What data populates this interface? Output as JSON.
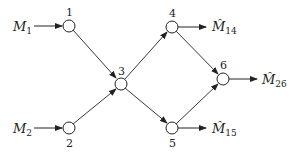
{
  "diagram": {
    "nodes": [
      {
        "id": "1",
        "label": "1"
      },
      {
        "id": "2",
        "label": "2"
      },
      {
        "id": "3",
        "label": "3"
      },
      {
        "id": "4",
        "label": "4"
      },
      {
        "id": "5",
        "label": "5"
      },
      {
        "id": "6",
        "label": "6"
      }
    ],
    "inputs": [
      {
        "to": "1",
        "symbol": "M",
        "subscript": "1"
      },
      {
        "to": "2",
        "symbol": "M",
        "subscript": "2"
      }
    ],
    "outputs": [
      {
        "from": "4",
        "symbol": "M̂",
        "subscript": "14"
      },
      {
        "from": "6",
        "symbol": "M̂",
        "subscript": "26"
      },
      {
        "from": "5",
        "symbol": "M̂",
        "subscript": "15"
      }
    ],
    "edges": [
      {
        "from": "1",
        "to": "3"
      },
      {
        "from": "2",
        "to": "3"
      },
      {
        "from": "3",
        "to": "4"
      },
      {
        "from": "3",
        "to": "5"
      },
      {
        "from": "4",
        "to": "6"
      },
      {
        "from": "5",
        "to": "6"
      }
    ]
  }
}
